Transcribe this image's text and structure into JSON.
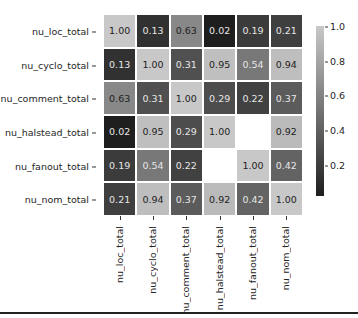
{
  "chart_data": {
    "type": "heatmap",
    "title": "",
    "rows": [
      "nu_loc_total",
      "nu_cyclo_total",
      "nu_comment_total",
      "nu_halstead_total",
      "nu_fanout_total",
      "nu_nom_total"
    ],
    "columns": [
      "nu_loc_total",
      "nu_cyclo_total",
      "nu_comment_total",
      "nu_halstead_total",
      "nu_fanout_total",
      "nu_nom_total"
    ],
    "values": [
      [
        1.0,
        0.13,
        0.63,
        0.02,
        0.19,
        0.21
      ],
      [
        0.13,
        1.0,
        0.31,
        0.95,
        0.54,
        0.94
      ],
      [
        0.63,
        0.31,
        1.0,
        0.29,
        0.22,
        0.37
      ],
      [
        0.02,
        0.95,
        0.29,
        1.0,
        null,
        0.92
      ],
      [
        0.19,
        0.54,
        0.22,
        null,
        1.0,
        0.42
      ],
      [
        0.21,
        0.94,
        0.37,
        0.92,
        0.42,
        1.0
      ]
    ],
    "colorbar": {
      "ticks": [
        "1.0",
        "0.8",
        "0.6",
        "0.4",
        "0.2"
      ],
      "range": [
        0.02,
        1.0
      ],
      "colormap": "grayscale dark-to-light"
    },
    "annotations": true,
    "value_format": "0.00"
  }
}
